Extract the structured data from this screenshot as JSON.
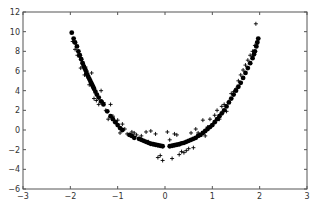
{
  "chart_data": {
    "type": "scatter",
    "title": "",
    "xlabel": "",
    "ylabel": "",
    "xlim": [
      -3,
      3
    ],
    "ylim": [
      -6,
      12
    ],
    "xticks": [
      -3,
      -2,
      -1,
      0,
      1,
      2,
      3
    ],
    "yticks": [
      -6,
      -4,
      -2,
      0,
      2,
      4,
      6,
      8,
      10,
      12
    ],
    "grid": false,
    "legend": null,
    "series": [
      {
        "name": "data",
        "marker": "+",
        "color": "#000000",
        "points": [
          [
            -1.95,
            9.0
          ],
          [
            -1.9,
            8.2
          ],
          [
            -1.85,
            7.6
          ],
          [
            -1.8,
            7.4
          ],
          [
            -1.78,
            6.3
          ],
          [
            -1.75,
            6.9
          ],
          [
            -1.7,
            5.6
          ],
          [
            -1.68,
            6.4
          ],
          [
            -1.65,
            6.0
          ],
          [
            -1.6,
            5.2
          ],
          [
            -1.6,
            4.6
          ],
          [
            -1.55,
            5.8
          ],
          [
            -1.5,
            4.1
          ],
          [
            -1.5,
            3.2
          ],
          [
            -1.45,
            3.0
          ],
          [
            -1.4,
            2.6
          ],
          [
            -1.35,
            4.0
          ],
          [
            -1.3,
            2.8
          ],
          [
            -1.25,
            2.0
          ],
          [
            -1.2,
            1.1
          ],
          [
            -1.15,
            2.6
          ],
          [
            -1.1,
            1.4
          ],
          [
            -1.05,
            0.8
          ],
          [
            -1.0,
            1.0
          ],
          [
            -0.95,
            -0.3
          ],
          [
            -0.9,
            0.6
          ],
          [
            -0.85,
            0.1
          ],
          [
            -0.8,
            -0.4
          ],
          [
            -0.7,
            -0.2
          ],
          [
            -0.65,
            -0.3
          ],
          [
            -0.6,
            -0.5
          ],
          [
            -0.5,
            -0.6
          ],
          [
            -0.4,
            -0.2
          ],
          [
            -0.35,
            -1.2
          ],
          [
            -0.3,
            -0.1
          ],
          [
            -0.2,
            -0.4
          ],
          [
            -0.15,
            -2.8
          ],
          [
            -0.1,
            -2.6
          ],
          [
            -0.05,
            -3.1
          ],
          [
            0.05,
            -0.2
          ],
          [
            0.1,
            -1.0
          ],
          [
            0.15,
            -2.9
          ],
          [
            0.2,
            -0.4
          ],
          [
            0.25,
            -0.5
          ],
          [
            0.3,
            -2.5
          ],
          [
            0.35,
            -2.2
          ],
          [
            0.4,
            -2.3
          ],
          [
            0.45,
            -2.1
          ],
          [
            0.5,
            -1.9
          ],
          [
            0.55,
            -0.3
          ],
          [
            0.6,
            -1.8
          ],
          [
            0.65,
            0.1
          ],
          [
            0.7,
            -0.3
          ],
          [
            0.8,
            1.0
          ],
          [
            0.85,
            -0.6
          ],
          [
            0.9,
            0.3
          ],
          [
            0.95,
            1.1
          ],
          [
            1.0,
            0.5
          ],
          [
            1.05,
            1.5
          ],
          [
            1.1,
            2.0
          ],
          [
            1.15,
            1.1
          ],
          [
            1.2,
            2.4
          ],
          [
            1.25,
            2.6
          ],
          [
            1.3,
            1.9
          ],
          [
            1.35,
            2.9
          ],
          [
            1.4,
            3.7
          ],
          [
            1.45,
            3.9
          ],
          [
            1.5,
            4.2
          ],
          [
            1.55,
            5.0
          ],
          [
            1.6,
            5.6
          ],
          [
            1.65,
            6.1
          ],
          [
            1.7,
            6.6
          ],
          [
            1.75,
            7.1
          ],
          [
            1.8,
            7.6
          ],
          [
            1.85,
            8.0
          ],
          [
            1.9,
            8.6
          ],
          [
            1.92,
            10.8
          ],
          [
            1.95,
            9.0
          ]
        ]
      },
      {
        "name": "fit",
        "marker": "o",
        "color": "#000000",
        "points": [
          [
            -1.97,
            9.9
          ],
          [
            -1.93,
            9.3
          ],
          [
            -1.9,
            8.9
          ],
          [
            -1.86,
            8.5
          ],
          [
            -1.83,
            8.0
          ],
          [
            -1.8,
            7.6
          ],
          [
            -1.77,
            7.2
          ],
          [
            -1.74,
            6.8
          ],
          [
            -1.72,
            6.5
          ],
          [
            -1.7,
            6.3
          ],
          [
            -1.68,
            6.1
          ],
          [
            -1.66,
            5.8
          ],
          [
            -1.64,
            5.6
          ],
          [
            -1.62,
            5.4
          ],
          [
            -1.6,
            5.2
          ],
          [
            -1.58,
            5.0
          ],
          [
            -1.56,
            4.8
          ],
          [
            -1.54,
            4.6
          ],
          [
            -1.52,
            4.4
          ],
          [
            -1.5,
            4.2
          ],
          [
            -1.47,
            3.9
          ],
          [
            -1.44,
            3.6
          ],
          [
            -1.4,
            3.3
          ],
          [
            -1.35,
            2.9
          ],
          [
            -1.3,
            2.6
          ],
          [
            -1.22,
            1.9
          ],
          [
            -1.15,
            1.4
          ],
          [
            -1.1,
            1.1
          ],
          [
            -1.05,
            0.8
          ],
          [
            -1.0,
            0.5
          ],
          [
            -0.95,
            0.2
          ],
          [
            -0.9,
            0.0
          ],
          [
            -0.75,
            -0.5
          ],
          [
            -0.7,
            -0.6
          ],
          [
            -0.65,
            -0.8
          ],
          [
            -0.55,
            -0.9
          ],
          [
            -0.5,
            -1.0
          ],
          [
            -0.45,
            -1.1
          ],
          [
            -0.4,
            -1.2
          ],
          [
            -0.35,
            -1.3
          ],
          [
            -0.3,
            -1.4
          ],
          [
            -0.25,
            -1.45
          ],
          [
            -0.2,
            -1.5
          ],
          [
            -0.15,
            -1.55
          ],
          [
            -0.1,
            -1.6
          ],
          [
            -0.05,
            -1.65
          ],
          [
            0.1,
            -1.65
          ],
          [
            0.15,
            -1.6
          ],
          [
            0.2,
            -1.55
          ],
          [
            0.25,
            -1.5
          ],
          [
            0.3,
            -1.45
          ],
          [
            0.35,
            -1.35
          ],
          [
            0.4,
            -1.3
          ],
          [
            0.45,
            -1.2
          ],
          [
            0.5,
            -1.1
          ],
          [
            0.55,
            -1.0
          ],
          [
            0.6,
            -0.9
          ],
          [
            0.65,
            -0.8
          ],
          [
            0.7,
            -0.6
          ],
          [
            0.75,
            -0.5
          ],
          [
            0.8,
            -0.3
          ],
          [
            0.85,
            -0.1
          ],
          [
            0.9,
            0.1
          ],
          [
            0.95,
            0.3
          ],
          [
            1.0,
            0.5
          ],
          [
            1.05,
            0.8
          ],
          [
            1.1,
            1.1
          ],
          [
            1.15,
            1.4
          ],
          [
            1.2,
            1.7
          ],
          [
            1.25,
            2.0
          ],
          [
            1.3,
            2.4
          ],
          [
            1.35,
            2.8
          ],
          [
            1.4,
            3.2
          ],
          [
            1.45,
            3.6
          ],
          [
            1.5,
            4.0
          ],
          [
            1.55,
            4.4
          ],
          [
            1.6,
            4.8
          ],
          [
            1.65,
            5.3
          ],
          [
            1.7,
            5.8
          ],
          [
            1.75,
            6.3
          ],
          [
            1.8,
            6.8
          ],
          [
            1.85,
            7.3
          ],
          [
            1.88,
            7.7
          ],
          [
            1.9,
            8.0
          ],
          [
            1.93,
            8.5
          ],
          [
            1.95,
            8.9
          ],
          [
            1.97,
            9.3
          ]
        ]
      }
    ]
  }
}
